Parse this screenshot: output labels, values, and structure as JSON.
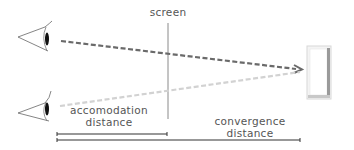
{
  "labels": {
    "screen": "screen",
    "accommodation_line1": "accomodation",
    "accommodation_line2": "distance",
    "convergence_line1": "convergence",
    "convergence_line2": "distance"
  },
  "colors": {
    "dark_dash": "#6a6a6a",
    "light_dash": "#d0d0d0",
    "line": "#333333",
    "screen_line": "#888888"
  },
  "icons": {
    "top_eye": "eye-icon",
    "bottom_eye": "eye-icon",
    "object": "box-object-icon"
  }
}
